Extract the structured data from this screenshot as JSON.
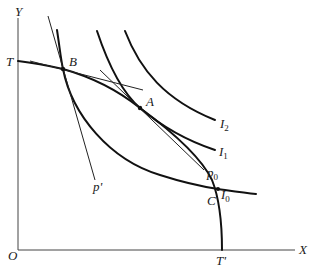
{
  "diagram": {
    "type": "production-possibility-frontier-with-indifference-curves",
    "axes": {
      "x_label": "X",
      "y_label": "Y",
      "origin_label": "O"
    },
    "frontier": {
      "start_label": "T",
      "end_label": "T'",
      "end_prime": "'"
    },
    "points": {
      "B": "B",
      "A": "A",
      "C": "C"
    },
    "indifference_curves": [
      {
        "id": "I0",
        "base": "I",
        "sub": "0"
      },
      {
        "id": "I1",
        "base": "I",
        "sub": "1"
      },
      {
        "id": "I2",
        "base": "I",
        "sub": "2"
      }
    ],
    "price_lines": [
      {
        "id": "p0",
        "base": "p",
        "sub": "0"
      },
      {
        "id": "p_prime",
        "label": "p'"
      }
    ]
  }
}
